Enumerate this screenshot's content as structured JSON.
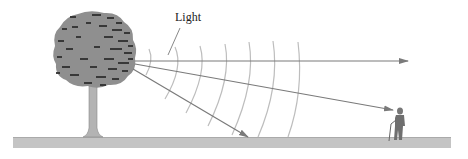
{
  "diagram": {
    "labels": {
      "light": "Light"
    },
    "elements": {
      "tree": "tree",
      "ground": "ground",
      "observer": "person-with-cane",
      "wavefronts_count": 7,
      "rays": [
        {
          "name": "horizontal-ray",
          "from": [
            135,
            61
          ],
          "to": [
            408,
            61
          ]
        },
        {
          "name": "ray-to-observer",
          "from": [
            135,
            63
          ],
          "to": [
            393,
            110
          ]
        },
        {
          "name": "ray-to-ground",
          "from": [
            133,
            68
          ],
          "to": [
            247,
            137
          ]
        }
      ]
    },
    "colors": {
      "foliage": "#8c8c8c",
      "foliage_dark": "#333333",
      "trunk": "#b0b0b0",
      "ground": "#c2c2c2",
      "ray": "#7a7a7a",
      "wavefront": "#bdbdbd",
      "text": "#222222"
    }
  }
}
